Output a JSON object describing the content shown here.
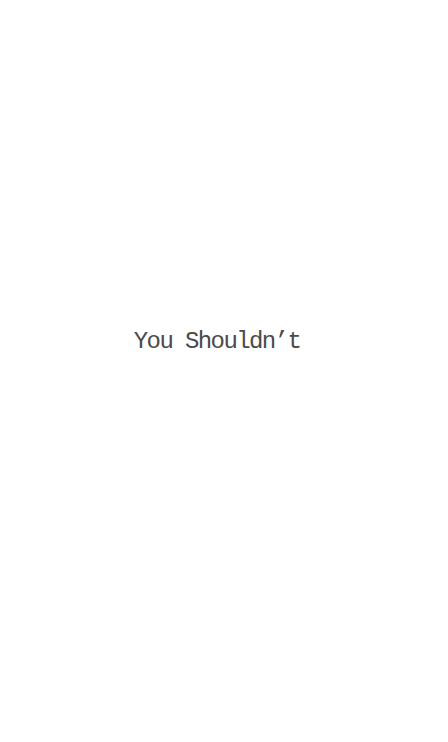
{
  "main": {
    "caption": "You Shouldn’t"
  },
  "colors": {
    "background": "#ffffff",
    "text": "#4a4a4a"
  }
}
